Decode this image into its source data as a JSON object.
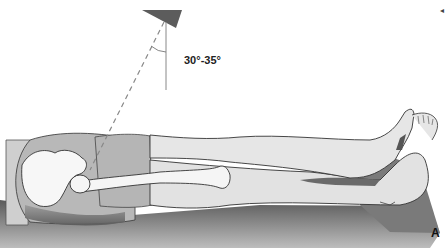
{
  "figure": {
    "angle_label": "30°-35°",
    "panel_letter": "A",
    "corner_mark": "◂"
  },
  "colors": {
    "table": "#6e6e6e",
    "table_light": "#8a8a8a",
    "skin": "#e4e4e4",
    "shorts": "#b9b9b9",
    "bone": "#f7f7f7",
    "outline": "#3a3a3a",
    "tube": "#5c5c5c",
    "central_ray": "#888888"
  }
}
